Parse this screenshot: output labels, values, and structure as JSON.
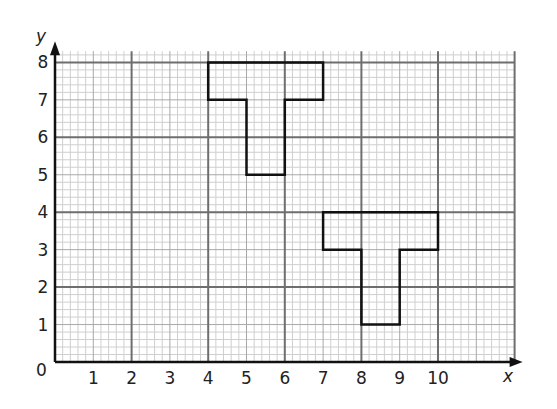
{
  "axes": {
    "x_label": "x",
    "y_label": "y",
    "origin_label": "0",
    "x_ticks": [
      "1",
      "2",
      "3",
      "4",
      "5",
      "6",
      "7",
      "8",
      "9",
      "10"
    ],
    "y_ticks": [
      "1",
      "2",
      "3",
      "4",
      "5",
      "6",
      "7",
      "8"
    ]
  },
  "grid": {
    "x_range": [
      0,
      12
    ],
    "y_range": [
      0,
      8.3
    ],
    "major_every": 2,
    "mid_every": 1,
    "minor_every": 0.2,
    "colors": {
      "major": "#6e6e6e",
      "mid": "#a8a8a8",
      "minor": "#cfcfcf",
      "outline": "#111111"
    }
  },
  "shapes": [
    {
      "name": "T-shape A",
      "vertices": [
        [
          4,
          8
        ],
        [
          7,
          8
        ],
        [
          7,
          7
        ],
        [
          6,
          7
        ],
        [
          6,
          5
        ],
        [
          5,
          5
        ],
        [
          5,
          7
        ],
        [
          4,
          7
        ]
      ]
    },
    {
      "name": "T-shape B",
      "vertices": [
        [
          7,
          4
        ],
        [
          10,
          4
        ],
        [
          10,
          3
        ],
        [
          9,
          3
        ],
        [
          9,
          1
        ],
        [
          8,
          1
        ],
        [
          8,
          3
        ],
        [
          7,
          3
        ]
      ]
    }
  ]
}
